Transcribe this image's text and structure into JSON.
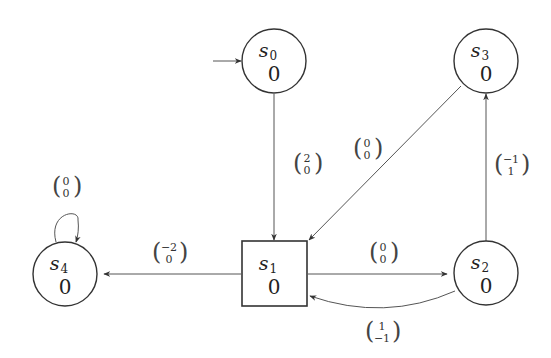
{
  "diagram": {
    "type": "state-transition-graph",
    "states": [
      {
        "id": "s0",
        "name": "s",
        "sub": "0",
        "value": "0",
        "shape": "circle",
        "initial": true
      },
      {
        "id": "s1",
        "name": "s",
        "sub": "1",
        "value": "0",
        "shape": "square",
        "initial": false
      },
      {
        "id": "s2",
        "name": "s",
        "sub": "2",
        "value": "0",
        "shape": "circle",
        "initial": false
      },
      {
        "id": "s3",
        "name": "s",
        "sub": "3",
        "value": "0",
        "shape": "circle",
        "initial": false
      },
      {
        "id": "s4",
        "name": "s",
        "sub": "4",
        "value": "0",
        "shape": "circle",
        "initial": false
      }
    ],
    "edges": [
      {
        "from": "s0",
        "to": "s1",
        "top": "2",
        "bottom": "0"
      },
      {
        "from": "s3",
        "to": "s1",
        "top": "0",
        "bottom": "0"
      },
      {
        "from": "s1",
        "to": "s4",
        "top": "−2",
        "bottom": "0"
      },
      {
        "from": "s1",
        "to": "s2",
        "top": "0",
        "bottom": "0"
      },
      {
        "from": "s2",
        "to": "s3",
        "top": "−1",
        "bottom": "1"
      },
      {
        "from": "s2",
        "to": "s1",
        "top": "1",
        "bottom": "−1"
      },
      {
        "from": "s4",
        "to": "s4",
        "top": "0",
        "bottom": "0"
      }
    ]
  }
}
